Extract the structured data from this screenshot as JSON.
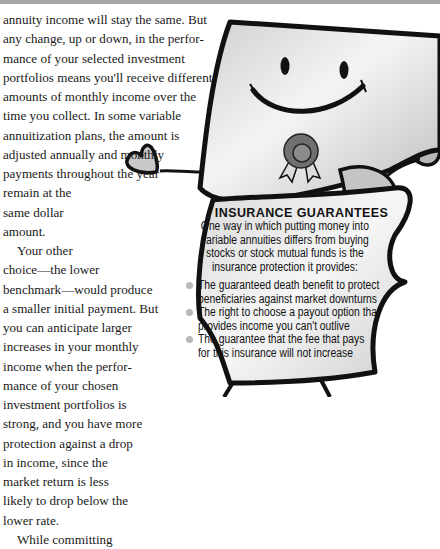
{
  "article": {
    "lines": [
      "annuity income will stay the same. But",
      "any change, up or down, in the perfor-",
      "mance of your selected investment",
      "portfolios means you'll receive different",
      "amounts of monthly income over the",
      "time you collect. In some variable",
      "annuitization plans, the amount is",
      "adjusted annually and monthly",
      "payments throughout the year",
      "remain at the",
      "same dollar",
      "amount.",
      "Your other",
      "choice—the lower",
      "benchmark—would produce",
      "a smaller initial payment. But",
      "you can anticipate larger",
      "increases in your monthly",
      "income when the perfor-",
      "mance of your chosen",
      "investment portfolios is",
      "strong, and you have more",
      "protection against a drop",
      "in income, since the",
      "market return is less",
      "likely to drop below the",
      "lower rate.",
      "While committing"
    ]
  },
  "sidebar_box": {
    "title": "INSURANCE GUARANTEES",
    "intro_lines": [
      "One way in which putting money into",
      "variable annuities differs from buying",
      "stocks or stock mutual funds is the",
      "insurance protection it provides:"
    ],
    "bullets": [
      {
        "lines": [
          "The guaranteed death benefit to protect",
          "beneficiaries against market downturns"
        ]
      },
      {
        "lines": [
          "The right to choose a payout option that",
          "provides income you can't outlive"
        ]
      },
      {
        "lines": [
          "The guarantee that the fee that pays",
          "for this insurance will not increase"
        ]
      }
    ]
  },
  "illustration": {
    "subject": "smiling document character with award ribbon",
    "colors": {
      "outline": "#111111",
      "paper_light": "#f2f2f2",
      "paper_dark": "#bdbdbd",
      "ribbon": "#6e6e6e",
      "bullet": "#b9b9b9"
    }
  }
}
